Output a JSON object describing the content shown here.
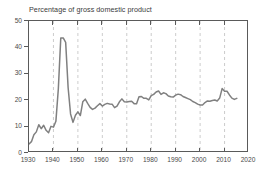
{
  "chart_data": {
    "type": "line",
    "title": "Percentage of gross domestic product",
    "subtitle": "",
    "xlabel": "",
    "ylabel": "",
    "xlim": [
      1930,
      2020
    ],
    "ylim": [
      0,
      50
    ],
    "xticks": [
      "1930",
      "1940",
      "1950",
      "1960",
      "1970",
      "1980",
      "1990",
      "2000",
      "2010",
      "2020"
    ],
    "yticks": [
      "0",
      "10",
      "20",
      "30",
      "40",
      "50"
    ],
    "grid": "vertical-dashed",
    "legend": "none",
    "line_color": "#808080",
    "axis_color": "#5a5a5a",
    "grid_color": "#bfbfbf",
    "series": [
      {
        "name": "Federal outlays as percentage of GDP",
        "x": [
          1930,
          1931,
          1932,
          1933,
          1934,
          1935,
          1936,
          1937,
          1938,
          1939,
          1940,
          1941,
          1942,
          1943,
          1944,
          1945,
          1946,
          1947,
          1948,
          1949,
          1950,
          1951,
          1952,
          1953,
          1954,
          1955,
          1956,
          1957,
          1958,
          1959,
          1960,
          1961,
          1962,
          1963,
          1964,
          1965,
          1966,
          1967,
          1968,
          1969,
          1970,
          1971,
          1972,
          1973,
          1974,
          1975,
          1976,
          1977,
          1978,
          1979,
          1980,
          1981,
          1982,
          1983,
          1984,
          1985,
          1986,
          1987,
          1988,
          1989,
          1990,
          1991,
          1992,
          1993,
          1994,
          1995,
          1996,
          1997,
          1998,
          1999,
          2000,
          2001,
          2002,
          2003,
          2004,
          2005,
          2006,
          2007,
          2008,
          2009,
          2010,
          2011,
          2012,
          2013,
          2014,
          2015
        ],
        "values": [
          3.4,
          4.3,
          6.9,
          8.0,
          10.7,
          9.2,
          10.5,
          8.6,
          7.7,
          10.1,
          9.8,
          12.0,
          24.3,
          43.6,
          43.6,
          41.9,
          24.8,
          14.8,
          11.6,
          14.3,
          15.6,
          14.2,
          19.4,
          20.4,
          18.8,
          17.3,
          16.5,
          17.0,
          17.9,
          18.7,
          17.8,
          18.4,
          18.8,
          18.6,
          18.5,
          17.2,
          17.8,
          19.4,
          20.5,
          19.4,
          19.3,
          19.5,
          19.6,
          18.7,
          18.7,
          21.3,
          21.4,
          20.7,
          20.7,
          20.1,
          21.7,
          22.2,
          23.1,
          23.5,
          22.2,
          22.8,
          22.5,
          21.6,
          21.3,
          21.2,
          21.9,
          22.3,
          22.1,
          21.4,
          21.0,
          20.6,
          20.2,
          19.5,
          19.1,
          18.5,
          18.2,
          18.2,
          19.1,
          19.7,
          19.6,
          19.9,
          20.1,
          19.7,
          20.8,
          24.4,
          23.4,
          23.4,
          22.0,
          20.8,
          20.3,
          20.7
        ]
      }
    ]
  }
}
